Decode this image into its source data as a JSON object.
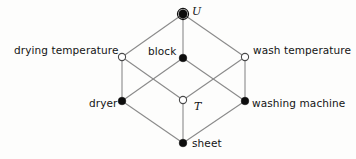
{
  "diagram": {
    "type": "concept-lattice-hasse-diagram",
    "shape": "cube",
    "background_color": "#fdfdfc",
    "edge_color": "#8a8a8a",
    "filled_node_color": "#0d0d0d",
    "open_node_fill": "#ffffff",
    "open_node_stroke": "#4a4a4a",
    "nodes": [
      {
        "id": "u",
        "label": "U",
        "style": "filled-ring",
        "cx": 183,
        "cy": 14,
        "r": 4.2,
        "label_pos": "right"
      },
      {
        "id": "drying-temperature",
        "label": "drying temperature",
        "style": "open",
        "cx": 122,
        "cy": 57,
        "r": 3.6,
        "label_pos": "left"
      },
      {
        "id": "block",
        "label": "block",
        "style": "filled",
        "cx": 183,
        "cy": 58,
        "r": 3.8,
        "label_pos": "left"
      },
      {
        "id": "wash-temperature",
        "label": "wash temperature",
        "style": "open",
        "cx": 245,
        "cy": 57,
        "r": 3.6,
        "label_pos": "right"
      },
      {
        "id": "dryer",
        "label": "dryer",
        "style": "filled",
        "cx": 122,
        "cy": 101,
        "r": 3.8,
        "label_pos": "left"
      },
      {
        "id": "t",
        "label": "T",
        "style": "open",
        "cx": 183,
        "cy": 100,
        "r": 3.6,
        "label_pos": "right"
      },
      {
        "id": "washing-machine",
        "label": "washing machine",
        "style": "filled",
        "cx": 245,
        "cy": 101,
        "r": 3.8,
        "label_pos": "right"
      },
      {
        "id": "sheet",
        "label": "sheet",
        "style": "filled",
        "cx": 183,
        "cy": 143,
        "r": 3.8,
        "label_pos": "right"
      }
    ],
    "edges": [
      {
        "from": "u",
        "to": "drying-temperature"
      },
      {
        "from": "u",
        "to": "block"
      },
      {
        "from": "u",
        "to": "wash-temperature"
      },
      {
        "from": "drying-temperature",
        "to": "dryer"
      },
      {
        "from": "drying-temperature",
        "to": "t"
      },
      {
        "from": "block",
        "to": "dryer"
      },
      {
        "from": "block",
        "to": "washing-machine"
      },
      {
        "from": "wash-temperature",
        "to": "t"
      },
      {
        "from": "wash-temperature",
        "to": "washing-machine"
      },
      {
        "from": "dryer",
        "to": "sheet"
      },
      {
        "from": "t",
        "to": "sheet"
      },
      {
        "from": "washing-machine",
        "to": "sheet"
      }
    ]
  }
}
